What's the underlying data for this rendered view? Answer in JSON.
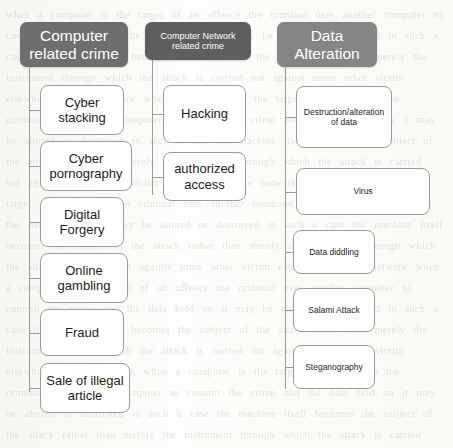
{
  "diagram": {
    "background_color": "#fdfdfb",
    "line_color": "#9b9b9b",
    "leaf_fill": "#ffffff",
    "ghost_text": "the scanned page shows faint show-through text from the reverse side of the sheet"
  },
  "columns": [
    {
      "id": "computer-related-crime",
      "header": {
        "label": "Computer related crime",
        "fill_color": "#6e6e6e",
        "text_color": "#ffffff",
        "text_size": "large",
        "x": 20,
        "y": 22,
        "w": 108,
        "h": 45
      },
      "trunk": {
        "x": 29,
        "y": 67,
        "h": 325
      },
      "children": [
        {
          "label": "Cyber stacking",
          "x": 40,
          "y": 85,
          "w": 84,
          "h": 50,
          "text_size": "large"
        },
        {
          "label": "Cyber pornography",
          "x": 40,
          "y": 141,
          "w": 92,
          "h": 50,
          "text_size": "large"
        },
        {
          "label": "Digital Forgery",
          "x": 40,
          "y": 197,
          "w": 84,
          "h": 50,
          "text_size": "large"
        },
        {
          "label": "Online gambling",
          "x": 40,
          "y": 253,
          "w": 88,
          "h": 50,
          "text_size": "large"
        },
        {
          "label": "Fraud",
          "x": 40,
          "y": 309,
          "w": 84,
          "h": 47,
          "text_size": "large"
        },
        {
          "label": "Sale of illegal article",
          "x": 40,
          "y": 363,
          "w": 90,
          "h": 50,
          "text_size": "large"
        }
      ]
    },
    {
      "id": "computer-network-related-crime",
      "header": {
        "label": "Computer Network related crime",
        "fill_color": "#5e5e5e",
        "text_color": "#ffffff",
        "text_size": "small",
        "x": 145,
        "y": 22,
        "w": 106,
        "h": 38
      },
      "trunk": {
        "x": 152,
        "y": 60,
        "h": 135
      },
      "children": [
        {
          "label": "Hacking",
          "x": 163,
          "y": 85,
          "w": 83,
          "h": 58,
          "text_size": "large"
        },
        {
          "label": "authorized access",
          "x": 163,
          "y": 152,
          "w": 83,
          "h": 49,
          "text_size": "large"
        }
      ]
    },
    {
      "id": "data-alteration",
      "header": {
        "label": "Data Alteration",
        "fill_color": "#858585",
        "text_color": "#ffffff",
        "text_size": "large",
        "x": 277,
        "y": 22,
        "w": 100,
        "h": 45
      },
      "trunk": {
        "x": 285,
        "y": 67,
        "h": 322
      },
      "children": [
        {
          "label": "Destruction/alteration of data",
          "x": 296,
          "y": 86,
          "w": 96,
          "h": 62,
          "text_size": "small"
        },
        {
          "label": "Virus",
          "x": 296,
          "y": 168,
          "w": 134,
          "h": 47,
          "text_size": "small"
        },
        {
          "label": "Data diddling",
          "x": 293,
          "y": 230,
          "w": 82,
          "h": 44,
          "text_size": "small"
        },
        {
          "label": "Salami Attack",
          "x": 293,
          "y": 288,
          "w": 82,
          "h": 44,
          "text_size": "small"
        },
        {
          "label": "Steganography",
          "x": 293,
          "y": 345,
          "w": 82,
          "h": 44,
          "text_size": "small"
        }
      ]
    }
  ]
}
